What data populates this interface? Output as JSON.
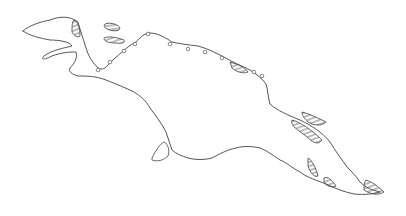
{
  "map": {
    "subject": "New Guinea island outline",
    "colors": {
      "stroke": "#555555",
      "background": "#ffffff"
    },
    "legend": [],
    "labels": [],
    "hatched_regions_count": 9
  }
}
